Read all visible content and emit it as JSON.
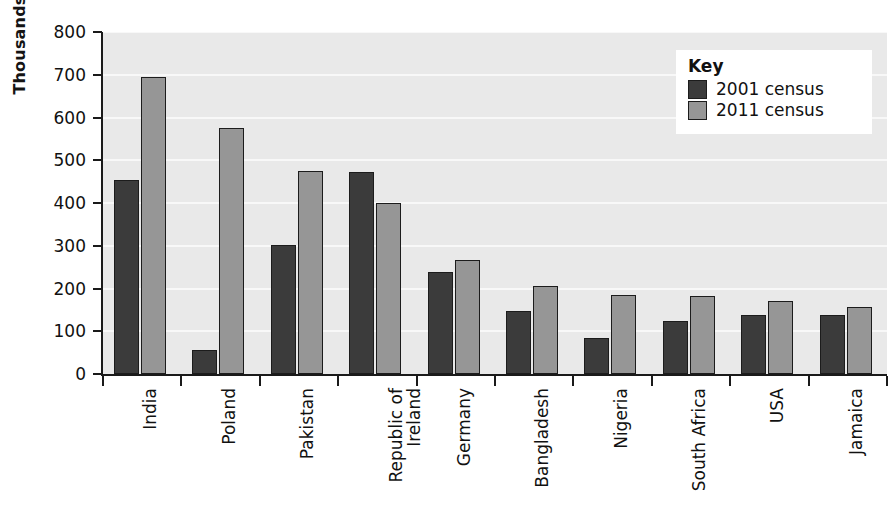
{
  "chart_data": {
    "type": "bar",
    "title": "",
    "subtitle": "",
    "xlabel": "",
    "ylabel": "Thousands",
    "ylim": [
      0,
      800
    ],
    "ytick_step": 100,
    "yticks": [
      800,
      700,
      600,
      500,
      400,
      300,
      200,
      100,
      0
    ],
    "grid": true,
    "grid_orientation": "horizontal",
    "legend_position": "top-right",
    "legend_title": "Key",
    "categories": [
      "India",
      "Poland",
      "Pakistan",
      "Republic of\nIreland",
      "Germany",
      "Bangladesh",
      "Nigeria",
      "South Africa",
      "USA",
      "Jamaica"
    ],
    "category_lines": [
      [
        "India"
      ],
      [
        "Poland"
      ],
      [
        "Pakistan"
      ],
      [
        "Republic of",
        "Ireland"
      ],
      [
        "Germany"
      ],
      [
        "Bangladesh"
      ],
      [
        "Nigeria"
      ],
      [
        "South Africa"
      ],
      [
        "USA"
      ],
      [
        "Jamaica"
      ]
    ],
    "series": [
      {
        "name": "2001 census",
        "color": "#3b3b3b",
        "values": [
          454,
          56,
          302,
          472,
          238,
          148,
          84,
          124,
          137,
          138
        ]
      },
      {
        "name": "2011 census",
        "color": "#969696",
        "values": [
          694,
          576,
          475,
          401,
          266,
          206,
          184,
          183,
          170,
          156
        ]
      }
    ]
  },
  "legend": {
    "title": "Key",
    "items": [
      {
        "label": "2001 census",
        "color": "#3b3b3b"
      },
      {
        "label": "2011 census",
        "color": "#969696"
      }
    ]
  },
  "axes": {
    "y_title": "Thousands",
    "y_tick_labels": [
      "800",
      "700",
      "600",
      "500",
      "400",
      "300",
      "200",
      "100",
      "0"
    ]
  },
  "colors": {
    "series_2001": "#3b3b3b",
    "series_2011": "#969696",
    "plot_background": "#e9e9e9",
    "gridline": "#f8f8f8",
    "axis": "#1a1a1a",
    "text": "#111111",
    "page_background": "#ffffff"
  }
}
